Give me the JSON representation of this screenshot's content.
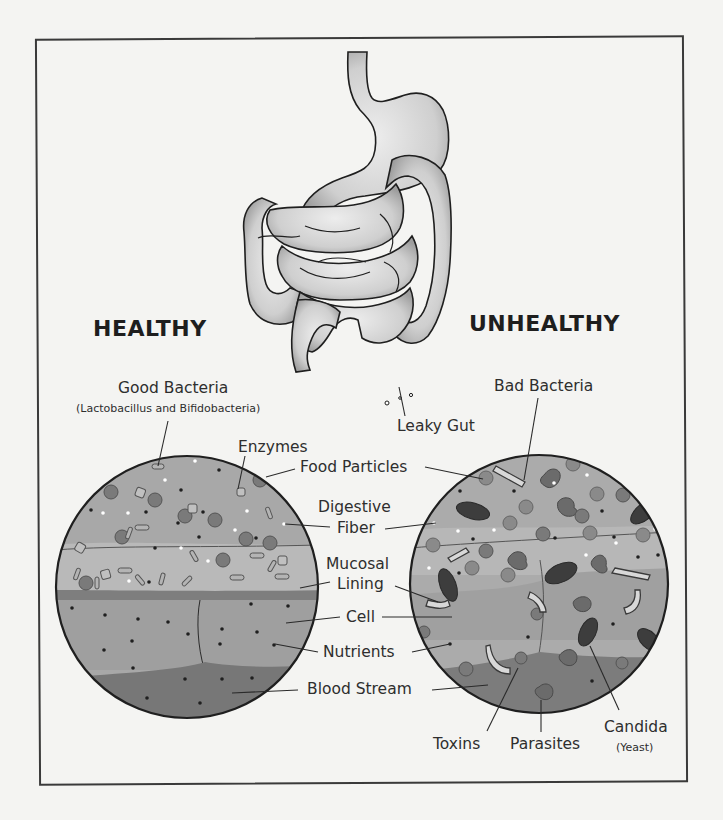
{
  "diagram": {
    "headings": {
      "healthy": "HEALTHY",
      "unhealthy": "UNHEALTHY"
    },
    "labels": {
      "good_bacteria": "Good Bacteria",
      "good_bacteria_sub": "(Lactobacillus and Bifidobacteria)",
      "enzymes": "Enzymes",
      "food_particles": "Food Particles",
      "digestive": "Digestive",
      "fiber": "Fiber",
      "mucosal": "Mucosal",
      "lining": "Lining",
      "cell": "Cell",
      "nutrients": "Nutrients",
      "blood_stream": "Blood Stream",
      "leaky_gut": "Leaky Gut",
      "bad_bacteria": "Bad Bacteria",
      "toxins": "Toxins",
      "parasites": "Parasites",
      "candida": "Candida",
      "candida_sub": "(Yeast)"
    },
    "colors": {
      "background": "#f4f4f2",
      "outline": "#1f1f1f",
      "lumen": "#a9a9a9",
      "mucosa": "#8c8c8c",
      "cell": "#9a9a9a",
      "blood": "#6f6f6f",
      "organ_fill": "#d6d6d6"
    }
  }
}
